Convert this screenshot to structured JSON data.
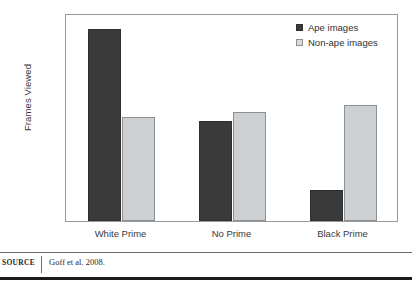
{
  "chart_data": {
    "type": "bar",
    "title": "",
    "xlabel": "",
    "ylabel": "Frames Viewed",
    "categories": [
      "White Prime",
      "No Prime",
      "Black Prime"
    ],
    "series": [
      {
        "name": "Ape images",
        "color": "#3a3a3a",
        "values": [
          26.4,
          22.85,
          20.2
        ]
      },
      {
        "name": "Non-ape images",
        "color": "#ccd0d2",
        "values": [
          23.0,
          23.2,
          23.45
        ]
      }
    ],
    "ylim": [
      19,
      27
    ],
    "yticks": [
      19,
      20,
      21,
      22,
      23,
      24,
      25,
      26,
      27
    ],
    "ytick_labels": [
      "19",
      "20",
      "21",
      "22",
      "23",
      "24",
      "25",
      "26",
      "27"
    ],
    "grid": false,
    "legend_position": "top-right",
    "bar_border_color_dark": "#2f2f2f",
    "bar_border_color_light": "#8d9093",
    "frame_color": "#9b9b9b"
  },
  "legend": {
    "items": [
      {
        "label": "Ape images",
        "swatch": "dark"
      },
      {
        "label": "Non-ape images",
        "swatch": "light"
      }
    ]
  },
  "axes": {
    "y_title": "Frames Viewed"
  },
  "source": {
    "label": "SOURCE",
    "text": "Goff et al. 2008."
  }
}
